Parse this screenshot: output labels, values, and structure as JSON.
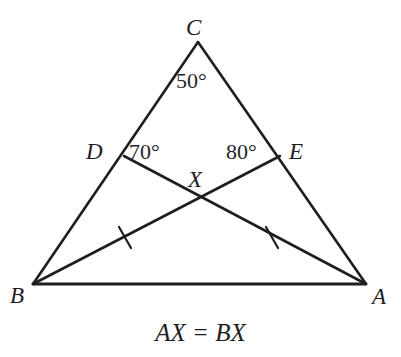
{
  "figure": {
    "type": "euclidean-geometry-diagram",
    "background_color": "#ffffff",
    "stroke_color": "#1d1d22",
    "stroke_width": 2.6,
    "caption": "AX = BX"
  },
  "vertices": {
    "a": {
      "label": "A",
      "x": 366,
      "y": 284
    },
    "b": {
      "label": "B",
      "x": 33,
      "y": 284
    },
    "c": {
      "label": "C",
      "x": 198,
      "y": 42
    }
  },
  "points": {
    "d": {
      "label": "D",
      "x": 124,
      "y": 156,
      "on_segment": "BC"
    },
    "e": {
      "label": "E",
      "x": 280,
      "y": 156,
      "on_segment": "CA"
    },
    "x": {
      "label": "X",
      "x": 200,
      "y": 198,
      "on_segment": "intersection of AD and BE"
    }
  },
  "angles": [
    {
      "name": "angle-at-c",
      "label": "50°",
      "value": 50,
      "at_vertex": "C"
    },
    {
      "name": "angle-at-d",
      "label": "70°",
      "value": 70,
      "at_vertex": "D"
    },
    {
      "name": "angle-at-e",
      "label": "80°",
      "value": 80,
      "at_vertex": "E"
    }
  ],
  "segments": [
    {
      "name": "side-bc",
      "from": "B",
      "to": "C"
    },
    {
      "name": "side-ca",
      "from": "C",
      "to": "A"
    },
    {
      "name": "side-ab",
      "from": "A",
      "to": "B"
    },
    {
      "name": "cevian-be",
      "from": "B",
      "to": "E",
      "tick_marks": 1
    },
    {
      "name": "cevian-ad",
      "from": "A",
      "to": "D",
      "tick_marks": 1
    }
  ],
  "tick_marks": [
    {
      "name": "tick-on-be",
      "x": 125,
      "y": 237
    },
    {
      "name": "tick-on-ad",
      "x": 272,
      "y": 237
    }
  ]
}
